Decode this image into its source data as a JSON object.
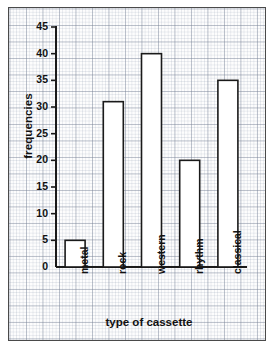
{
  "chart_data": {
    "type": "bar",
    "title": "",
    "subtitle": "",
    "xlabel": "type of cassette",
    "ylabel": "frequencies",
    "categories": [
      "metal",
      "rock",
      "western",
      "rhythm",
      "classical"
    ],
    "values": [
      5,
      31,
      40,
      20,
      35
    ],
    "series": [
      {
        "name": "frequencies",
        "values": [
          5,
          31,
          40,
          20,
          35
        ]
      }
    ],
    "ylim": [
      0,
      45
    ],
    "ytick_labels": [
      "0",
      "5",
      "10",
      "15",
      "20",
      "25",
      "30",
      "35",
      "40",
      "45"
    ],
    "ytick_values": [
      0,
      5,
      10,
      15,
      20,
      25,
      30,
      35,
      40,
      45
    ],
    "grid": true,
    "grid_style": "graph-paper",
    "legend": false,
    "legend_position": "none",
    "bar_fill_color": "#ffffff",
    "bar_edge_color": "#1a1a1a",
    "axis_color": "#1a1a1a",
    "grid_color": "#8d97ab",
    "background_color": "#fdfdfd",
    "frame_border_color": "#4a4a4a",
    "annotations": []
  }
}
